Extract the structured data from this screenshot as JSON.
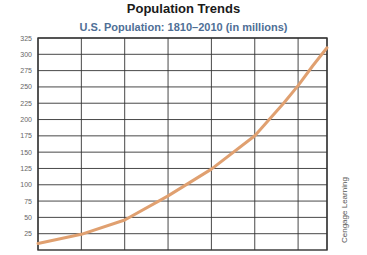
{
  "title": "Population Trends",
  "subtitle": "U.S. Population: 1810–2010 (in millions)",
  "credit": "Cengage Learning",
  "colors": {
    "line": "#e0a070",
    "grid": "#333333",
    "subtitle": "#4f6f96"
  },
  "chart_data": {
    "type": "line",
    "title": "U.S. Population: 1810–2010 (in millions)",
    "xlabel": "",
    "ylabel": "",
    "x": [
      1810,
      1840,
      1870,
      1900,
      1930,
      1960,
      1980,
      1990,
      2000,
      2010
    ],
    "series": [
      {
        "name": "U.S. Population (millions)",
        "values": [
          10,
          24,
          46,
          83,
          124,
          175,
          225,
          252,
          282,
          310
        ]
      }
    ],
    "xlim": [
      1810,
      2010
    ],
    "ylim": [
      0,
      325
    ],
    "yticks": [
      25,
      50,
      75,
      100,
      125,
      150,
      175,
      200,
      225,
      250,
      275,
      300,
      325
    ],
    "xgrid": [
      1810,
      1840,
      1870,
      1900,
      1930,
      1960,
      1990,
      2010
    ],
    "grid": true,
    "legend": "none"
  }
}
